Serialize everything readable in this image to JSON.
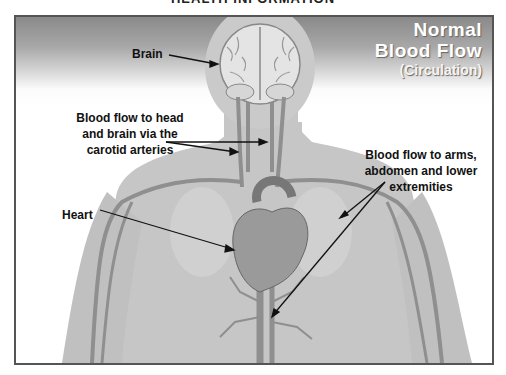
{
  "header": {
    "cut_off_title": "HEALTH INFORMATION"
  },
  "diagram": {
    "title": {
      "line1": "Normal",
      "line2": "Blood Flow",
      "line3": "(Circulation)"
    },
    "labels": {
      "brain": "Brain",
      "carotid_line1": "Blood flow to head",
      "carotid_line2": "and brain via the",
      "carotid_line3": "carotid arteries",
      "heart": "Heart",
      "limbs_line1": "Blood flow to arms,",
      "limbs_line2": "abdomen and lower",
      "limbs_line3": "extremities"
    },
    "colors": {
      "background_top": "#8a8a8a",
      "body_skin": "#c4c4c4",
      "vessels": "#8a8a8a",
      "frame": "#555555"
    }
  }
}
